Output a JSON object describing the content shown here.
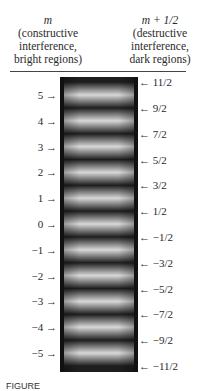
{
  "headers": {
    "left": {
      "variable": "m",
      "line1": "(constructive",
      "line2": "interference,",
      "line3": "bright regions)"
    },
    "right": {
      "variable": "m + 1/2",
      "line1": "(destructive",
      "line2": "interference,",
      "line3": "dark regions)"
    }
  },
  "bright_orders": [
    {
      "order": 5,
      "label": "5"
    },
    {
      "order": 4,
      "label": "4"
    },
    {
      "order": 3,
      "label": "3"
    },
    {
      "order": 2,
      "label": "2"
    },
    {
      "order": 1,
      "label": "1"
    },
    {
      "order": 0,
      "label": "0"
    },
    {
      "order": -1,
      "label": "−1"
    },
    {
      "order": -2,
      "label": "−2"
    },
    {
      "order": -3,
      "label": "−3"
    },
    {
      "order": -4,
      "label": "−4"
    },
    {
      "order": -5,
      "label": "−5"
    }
  ],
  "dark_orders": [
    {
      "order": 5.5,
      "label": "11/2"
    },
    {
      "order": 4.5,
      "label": "9/2"
    },
    {
      "order": 3.5,
      "label": "7/2"
    },
    {
      "order": 2.5,
      "label": "5/2"
    },
    {
      "order": 1.5,
      "label": "3/2"
    },
    {
      "order": 0.5,
      "label": "1/2"
    },
    {
      "order": -0.5,
      "label": "−1/2"
    },
    {
      "order": -1.5,
      "label": "−3/2"
    },
    {
      "order": -2.5,
      "label": "−5/2"
    },
    {
      "order": -3.5,
      "label": "−7/2"
    },
    {
      "order": -4.5,
      "label": "−9/2"
    },
    {
      "order": -5.5,
      "label": "−11/2"
    }
  ],
  "arrows": {
    "right_pointing": "→",
    "left_pointing": "←"
  },
  "colors": {
    "bright": "#d8d8d8",
    "dark": "#1e1e1e",
    "border": "#111111"
  },
  "caption": "FIGURE"
}
